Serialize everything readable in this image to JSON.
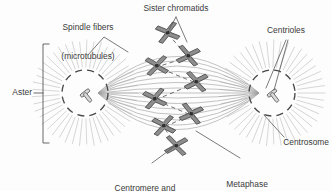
{
  "figure": {
    "title_alt": "Mitotic spindle at metaphase",
    "background_color": "#fdfdfd",
    "ink_color": "#3b3b3b",
    "fiber_color": "#9a9a9a",
    "aster_ray_color": "#c2c2c2",
    "chromosome_fill": "#8e8e8e",
    "chromosome_stroke": "#4a4a4a"
  },
  "labels": {
    "spindle_fibers_line1": "Spindle fibers",
    "spindle_fibers_line2": "(microtubules)",
    "sister_chromatids": "Sister chromatids",
    "centrioles": "Centrioles",
    "centrosome": "Centrosome",
    "aster": "Aster",
    "centromere_line1": "Centromere and",
    "centromere_line2": "kinetochores",
    "metaphase_line1": "Metaphase",
    "metaphase_line2": "plate"
  },
  "structures": {
    "left_aster": {
      "cx": 85,
      "cy": 93,
      "r": 23,
      "ray_count": 46,
      "ray_inner": 26,
      "ray_outer": 53
    },
    "right_aster": {
      "cx": 272,
      "cy": 93,
      "r": 23,
      "ray_count": 46,
      "ray_inner": 26,
      "ray_outer": 53
    },
    "spindle_fiber_count": 15,
    "metaphase_plate_style": "dashed vertical zigzag",
    "chromosome_count": 8,
    "chromosomes": [
      {
        "cx": 168,
        "cy": 34,
        "rot": -15
      },
      {
        "cx": 188,
        "cy": 57,
        "rot": 12
      },
      {
        "cx": 157,
        "cy": 67,
        "rot": -8
      },
      {
        "cx": 196,
        "cy": 83,
        "rot": 10
      },
      {
        "cx": 155,
        "cy": 100,
        "rot": -12
      },
      {
        "cx": 191,
        "cy": 115,
        "rot": 14
      },
      {
        "cx": 164,
        "cy": 127,
        "rot": -10
      },
      {
        "cx": 176,
        "cy": 147,
        "rot": 8
      }
    ]
  }
}
